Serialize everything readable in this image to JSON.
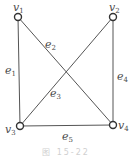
{
  "diagram": {
    "type": "graph",
    "vertices": [
      {
        "id": "v1",
        "name": "v",
        "sub": "1",
        "x": 18,
        "y": 17
      },
      {
        "id": "v2",
        "name": "v",
        "sub": "2",
        "x": 113,
        "y": 17
      },
      {
        "id": "v3",
        "name": "v",
        "sub": "3",
        "x": 20,
        "y": 126
      },
      {
        "id": "v4",
        "name": "v",
        "sub": "4",
        "x": 113,
        "y": 125
      }
    ],
    "edges": [
      {
        "id": "e1",
        "name": "e",
        "sub": "1",
        "from": "v1",
        "to": "v3"
      },
      {
        "id": "e2",
        "name": "e",
        "sub": "2",
        "from": "v1",
        "to": "v4"
      },
      {
        "id": "e3",
        "name": "e",
        "sub": "3",
        "from": "v3",
        "to": "v2"
      },
      {
        "id": "e4",
        "name": "e",
        "sub": "4",
        "from": "v2",
        "to": "v4"
      },
      {
        "id": "e5",
        "name": "e",
        "sub": "5",
        "from": "v3",
        "to": "v4"
      }
    ],
    "labels": {
      "v1": {
        "name": "v",
        "sub": "1"
      },
      "v2": {
        "name": "v",
        "sub": "2"
      },
      "v3": {
        "name": "v",
        "sub": "3"
      },
      "v4": {
        "name": "v",
        "sub": "4"
      },
      "e1": {
        "name": "e",
        "sub": "1"
      },
      "e2": {
        "name": "e",
        "sub": "2"
      },
      "e3": {
        "name": "e",
        "sub": "3"
      },
      "e4": {
        "name": "e",
        "sub": "4"
      },
      "e5": {
        "name": "e",
        "sub": "5"
      }
    },
    "caption": "图 15-22",
    "colors": {
      "line": "#555555",
      "vertex_stroke": "#333333",
      "vertex_fill": "#ffffff",
      "label": "#4a4a4a",
      "caption": "#d0d0d0"
    }
  }
}
